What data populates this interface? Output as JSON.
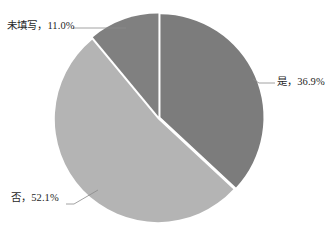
{
  "chart_data": {
    "type": "pie",
    "title": "",
    "subtitle": "",
    "xlabel": "",
    "ylabel": "",
    "legend_position": "none",
    "grid": false,
    "labels_outside": true,
    "categories": [
      "是",
      "否",
      "未填写"
    ],
    "values": [
      36.9,
      52.1,
      11.0
    ],
    "value_unit": "%",
    "start_angle_deg": 0,
    "direction": "clockwise",
    "slices": [
      {
        "name": "是",
        "label": "是，36.9%",
        "category": "是",
        "value": 36.9,
        "percent_text": "36.9%",
        "color": "#7c7c7c",
        "start_deg": 0,
        "end_deg": 132.84,
        "leader": "short-diagonal-right"
      },
      {
        "name": "否",
        "label": "否，52.1%",
        "category": "否",
        "value": 52.1,
        "percent_text": "52.1%",
        "color": "#b4b4b4",
        "start_deg": 132.84,
        "end_deg": 320.4,
        "leader": "diagonal-bottom-left"
      },
      {
        "name": "未填写",
        "label": "未填写，11.0%",
        "category": "未填写",
        "value": 11.0,
        "percent_text": "11.0%",
        "color": "#808080",
        "start_deg": 320.4,
        "end_deg": 360,
        "leader": "horizontal-top-left"
      }
    ]
  },
  "labels": {
    "weitianxie": "未填写，11.0%",
    "shi": "是，36.9%",
    "fou": "否，52.1%"
  },
  "colors": {
    "background": "#ffffff",
    "slice_shi": "#7c7c7c",
    "slice_fou": "#b4b4b4",
    "slice_weitianxie": "#808080",
    "separator": "#ffffff",
    "leader_line": "#8a8a8a",
    "label_text": "#1f1f1f"
  },
  "geometry": {
    "center_x": 159,
    "center_y": 118,
    "radius": 103
  }
}
